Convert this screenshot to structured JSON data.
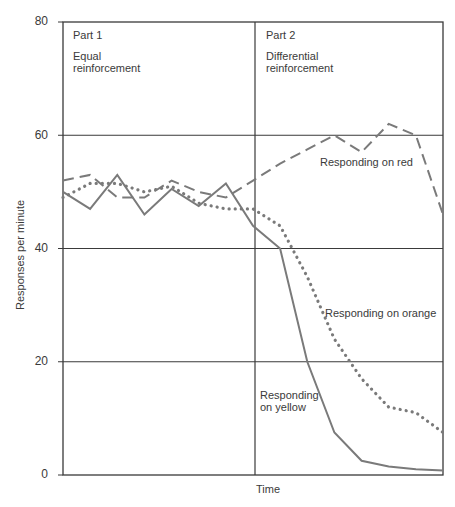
{
  "chart_data": {
    "type": "line",
    "title": "",
    "xlabel": "Time",
    "ylabel": "Responses per minute",
    "ylim": [
      0,
      80
    ],
    "yticks": [
      "0",
      "20",
      "40",
      "60",
      "80"
    ],
    "grid": true,
    "panels": [
      {
        "label": "Part 1",
        "sublabel": [
          "Equal",
          "reinforcement"
        ]
      },
      {
        "label": "Part 2",
        "sublabel": [
          "Differential",
          "reinforcement"
        ]
      }
    ],
    "x": [
      0,
      1,
      2,
      3,
      4,
      5,
      6,
      7,
      8,
      9,
      10,
      11,
      12,
      13,
      14
    ],
    "series": [
      {
        "name": "Responding on red",
        "style": "dashed",
        "values": [
          52,
          53,
          49,
          49,
          52,
          50,
          49,
          52,
          55,
          57.5,
          60,
          57,
          62,
          60,
          46
        ]
      },
      {
        "name": "Responding on orange",
        "style": "dotted",
        "values": [
          49,
          51.5,
          51.5,
          50,
          51,
          48,
          47,
          47,
          44,
          35,
          24,
          17,
          12,
          11,
          7.5
        ]
      },
      {
        "name": "Responding on yellow",
        "style": "solid",
        "values": [
          50,
          47,
          53,
          46,
          50.5,
          47.5,
          51.5,
          44,
          40,
          20,
          7.5,
          2.5,
          1.5,
          1,
          0.8
        ]
      }
    ],
    "annotations": [
      {
        "text": "Responding on red"
      },
      {
        "text": "Responding on orange"
      },
      {
        "text": [
          "Responding",
          "on yellow"
        ]
      }
    ]
  },
  "labels": {
    "part1": "Part 1",
    "part1_sub1": "Equal",
    "part1_sub2": "reinforcement",
    "part2": "Part 2",
    "part2_sub1": "Differential",
    "part2_sub2": "reinforcement",
    "red": "Responding on red",
    "orange": "Responding on orange",
    "yellow1": "Responding",
    "yellow2": "on yellow",
    "xlabel": "Time",
    "ylabel": "Responses per minute",
    "y0": "0",
    "y20": "20",
    "y40": "40",
    "y60": "60",
    "y80": "80"
  }
}
